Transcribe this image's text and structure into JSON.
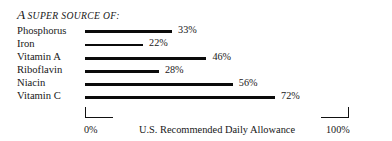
{
  "chart_data": {
    "type": "bar",
    "orientation": "horizontal",
    "title_lead": "A",
    "title_rest": "SUPER SOURCE OF:",
    "subtitle": "",
    "xlabel": "U.S. Recommended Daily Allowance",
    "ylabel": "",
    "xlim": [
      0,
      100
    ],
    "grid": false,
    "legend": "none",
    "categories": [
      "Phosphorus",
      "Iron",
      "Vitamin A",
      "Riboflavin",
      "Niacin",
      "Vitamin C"
    ],
    "values": [
      33,
      22,
      46,
      28,
      56,
      72
    ],
    "value_labels": [
      "33%",
      "22%",
      "46%",
      "28%",
      "56%",
      "72%"
    ],
    "xticks": [
      0,
      100
    ],
    "xtick_labels": [
      "0%",
      "100%"
    ],
    "bar_color": "#0b0b0b",
    "text_color": "#171717",
    "background": "#ffffff",
    "rows": [
      {
        "label": "Phosphorus",
        "value": 33,
        "value_label": "33%"
      },
      {
        "label": "Iron",
        "value": 22,
        "value_label": "22%"
      },
      {
        "label": "Vitamin A",
        "value": 46,
        "value_label": "46%"
      },
      {
        "label": "Riboflavin",
        "value": 28,
        "value_label": "28%"
      },
      {
        "label": "Niacin",
        "value": 56,
        "value_label": "56%"
      },
      {
        "label": "Vitamin C",
        "value": 72,
        "value_label": "72%"
      }
    ]
  }
}
